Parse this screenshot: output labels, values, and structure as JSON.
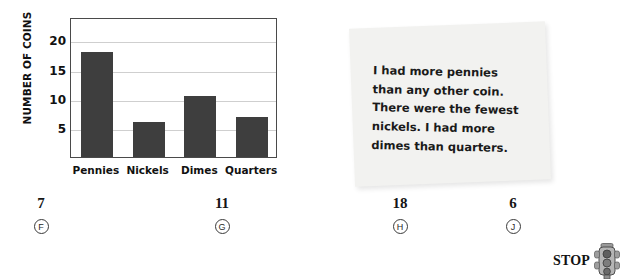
{
  "chart_data": {
    "type": "bar",
    "title": "",
    "xlabel": "",
    "ylabel": "NUMBER OF COINS",
    "categories": [
      "Pennies",
      "Nickels",
      "Dimes",
      "Quarters"
    ],
    "values": [
      18,
      6,
      10.5,
      6.8
    ],
    "ylim": [
      0,
      24
    ],
    "yticks": [
      5,
      10,
      15,
      20
    ],
    "ytick_labels": [
      "5",
      "10",
      "15",
      "20"
    ],
    "grid": true,
    "legend": false,
    "bar_color": "#3e3e3e",
    "grid_color": "#cfcfcf",
    "frame_color": "#4a4a4a"
  },
  "note": {
    "lines": [
      "I had more pennies",
      "than any other coin.",
      "There were the fewest",
      "nickels. I had more",
      "dimes than quarters."
    ],
    "background_color": "#f2f2f0"
  },
  "answers": {
    "choices": [
      {
        "value": "7",
        "letter": "F"
      },
      {
        "value": "11",
        "letter": "G"
      },
      {
        "value": "18",
        "letter": "H"
      },
      {
        "value": "6",
        "letter": "J"
      }
    ]
  },
  "stop": {
    "label": "STOP",
    "icon": "traffic-light-icon"
  }
}
